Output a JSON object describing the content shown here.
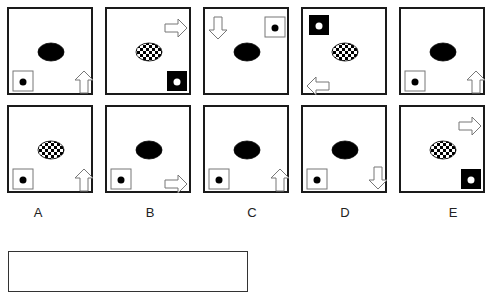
{
  "puzzle": {
    "row1": [
      {
        "oval": "solid",
        "oval_pos": [
          50,
          47
        ],
        "square": {
          "style": "outline",
          "pos": [
            4,
            62
          ]
        },
        "arrow": {
          "dir": "up",
          "pos": [
            66,
            62
          ]
        }
      },
      {
        "oval": "checkered",
        "oval_pos": [
          50,
          47
        ],
        "square": {
          "style": "filled",
          "pos": [
            60,
            62
          ]
        },
        "arrow": {
          "dir": "right",
          "pos": [
            60,
            8
          ]
        }
      },
      {
        "oval": "solid",
        "oval_pos": [
          50,
          47
        ],
        "square": {
          "style": "outline",
          "pos": [
            60,
            8
          ]
        },
        "arrow": {
          "dir": "down",
          "pos": [
            4,
            8
          ]
        }
      },
      {
        "oval": "checkered",
        "oval_pos": [
          50,
          47
        ],
        "square": {
          "style": "filled",
          "pos": [
            6,
            6
          ]
        },
        "arrow": {
          "dir": "left",
          "pos": [
            6,
            66
          ]
        }
      },
      {
        "oval": "solid",
        "oval_pos": [
          50,
          47
        ],
        "square": {
          "style": "outline",
          "pos": [
            4,
            62
          ]
        },
        "arrow": {
          "dir": "up",
          "pos": [
            66,
            62
          ]
        }
      }
    ],
    "row2": [
      {
        "oval": "checkered",
        "oval_pos": [
          50,
          47
        ],
        "square": {
          "style": "outline",
          "pos": [
            4,
            62
          ]
        },
        "arrow": {
          "dir": "up",
          "pos": [
            66,
            62
          ]
        }
      },
      {
        "oval": "solid",
        "oval_pos": [
          50,
          47
        ],
        "square": {
          "style": "outline",
          "pos": [
            4,
            62
          ]
        },
        "arrow": {
          "dir": "right",
          "pos": [
            60,
            66
          ]
        }
      },
      {
        "oval": "solid",
        "oval_pos": [
          50,
          47
        ],
        "square": {
          "style": "outline",
          "pos": [
            4,
            62
          ]
        },
        "arrow": {
          "dir": "up",
          "pos": [
            66,
            62
          ]
        }
      },
      {
        "oval": "solid",
        "oval_pos": [
          50,
          47
        ],
        "square": {
          "style": "outline",
          "pos": [
            4,
            62
          ]
        },
        "arrow": {
          "dir": "down",
          "pos": [
            66,
            60
          ]
        }
      },
      {
        "oval": "checkered",
        "oval_pos": [
          50,
          47
        ],
        "square": {
          "style": "filled",
          "pos": [
            60,
            62
          ]
        },
        "arrow": {
          "dir": "right",
          "pos": [
            60,
            8
          ]
        }
      }
    ]
  },
  "options": [
    "A",
    "B",
    "C",
    "D",
    "E"
  ],
  "answer_box": {
    "value": ""
  }
}
